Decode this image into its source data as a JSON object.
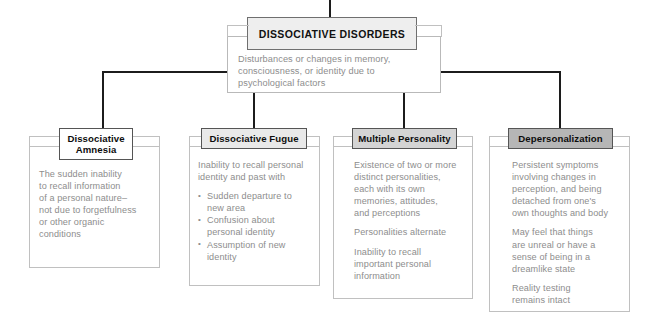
{
  "diagram": {
    "type": "hierarchy-chart",
    "root": {
      "title": "DISSOCIATIVE DISORDERS",
      "description": "Disturbances or changes in memory,\nconsciousness, or identity due to\npsychological factors",
      "header_color": "#eeeeee"
    },
    "nodes": [
      {
        "title": "Dissociative\nAmnesia",
        "header_color": "#ffffff",
        "blocks": [
          {
            "kind": "paragraph",
            "text": "The sudden inability\nto recall information\nof a personal nature–\nnot due to forgetfulness\nor other organic\nconditions"
          }
        ]
      },
      {
        "title": "Dissociative Fugue",
        "header_color": "#e9e9e9",
        "blocks": [
          {
            "kind": "paragraph",
            "text": "Inability to recall personal\nidentity and past with"
          },
          {
            "kind": "list",
            "items": [
              "Sudden departure to\nnew area",
              "Confusion about\npersonal identity",
              "Assumption of new\nidentity"
            ]
          }
        ]
      },
      {
        "title": "Multiple Personality",
        "header_color": "#d4d4d4",
        "blocks": [
          {
            "kind": "paragraph",
            "text": "Existence of two or more\ndistinct personalities,\neach with its own\nmemories, attitudes,\nand perceptions"
          },
          {
            "kind": "paragraph",
            "text": "Personalities alternate"
          },
          {
            "kind": "paragraph",
            "text": "Inability to recall\nimportant personal\ninformation"
          }
        ]
      },
      {
        "title": "Depersonalization",
        "header_color": "#b6b6b6",
        "blocks": [
          {
            "kind": "paragraph",
            "text": "Persistent symptoms\ninvolving changes in\nperception, and being\ndetached from one's\nown thoughts and body"
          },
          {
            "kind": "paragraph",
            "text": "May feel that things\nare unreal or have a\nsense of being in a\ndreamlike state"
          },
          {
            "kind": "paragraph",
            "text": "Reality testing\nremains intact"
          }
        ]
      }
    ],
    "colors": {
      "connector": "#1c1c1c",
      "body_border": "#c0c0c0",
      "header_border": "#555555",
      "body_text": "#8d8d8d",
      "title_text": "#0d0d0d",
      "background": "#ffffff"
    }
  }
}
